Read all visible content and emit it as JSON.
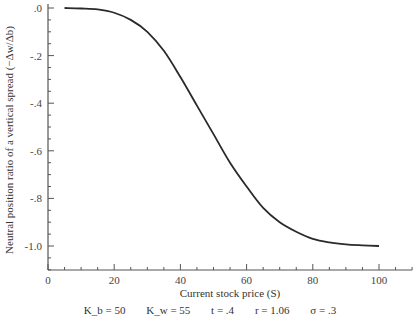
{
  "chart_data": {
    "type": "line",
    "title": "",
    "xlabel": "Current stock price (S)",
    "ylabel": "Neutral position ratio of a vertical spread (−Δw/Δb)",
    "xlim": [
      0,
      110
    ],
    "ylim": [
      -1.1,
      0.0
    ],
    "grid": false,
    "x_ticks": [
      "0",
      "20",
      "40",
      "60",
      "80",
      "100"
    ],
    "y_ticks": [
      ".0",
      "-.2",
      "-.4",
      "-.6",
      "-.8",
      "-1.0"
    ],
    "series": [
      {
        "name": "Neutral position ratio",
        "x": [
          5,
          10,
          15,
          20,
          25,
          30,
          35,
          40,
          45,
          50,
          55,
          60,
          65,
          70,
          75,
          80,
          85,
          90,
          95,
          100
        ],
        "y": [
          0.0,
          -0.002,
          -0.006,
          -0.02,
          -0.05,
          -0.1,
          -0.18,
          -0.29,
          -0.41,
          -0.53,
          -0.65,
          -0.75,
          -0.84,
          -0.9,
          -0.94,
          -0.97,
          -0.985,
          -0.993,
          -0.997,
          -1.0
        ]
      }
    ],
    "annotation": "Kb = 50   Kw = 55   t = .4   r = 1.06   σ = .3"
  },
  "params": {
    "kb": "K_b = 50",
    "kw": "K_w = 55",
    "t": "t = .4",
    "r": "r = 1.06",
    "sigma": "σ = .3"
  }
}
